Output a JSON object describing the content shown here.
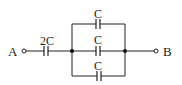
{
  "diagram": {
    "type": "capacitor-circuit",
    "terminals": [
      {
        "id": "A",
        "label": "A"
      },
      {
        "id": "B",
        "label": "B"
      }
    ],
    "capacitors": [
      {
        "id": "c-series",
        "label": "2C",
        "position": "series"
      },
      {
        "id": "c-top",
        "label": "C",
        "position": "parallel-top"
      },
      {
        "id": "c-middle",
        "label": "C",
        "position": "parallel-middle"
      },
      {
        "id": "c-bottom",
        "label": "C",
        "position": "parallel-bottom"
      }
    ],
    "colors": {
      "line": "#222222",
      "background": "#ffffff"
    }
  }
}
